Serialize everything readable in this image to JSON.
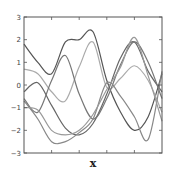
{
  "chart_data": {
    "type": "line",
    "title": "",
    "xlabel": "x",
    "ylabel": "",
    "ylim": [
      -3,
      3
    ],
    "xlim": [
      0,
      1
    ],
    "yticks": [
      -3,
      -2,
      -1,
      0,
      1,
      2,
      3
    ],
    "ytick_labels": [
      "−3",
      "−2",
      "−1",
      "0",
      "1",
      "2",
      "3"
    ],
    "xticks": [
      0.2,
      0.4,
      0.6,
      0.8
    ],
    "xtick_labels": [
      "",
      "",
      "",
      ""
    ],
    "grid": false,
    "legend": null,
    "x": [
      0.0,
      0.1,
      0.2,
      0.3,
      0.4,
      0.5,
      0.6,
      0.7,
      0.8,
      0.9,
      1.0
    ],
    "series": [
      {
        "name": "sample-1",
        "color": "#555555",
        "values": [
          1.8,
          1.0,
          0.5,
          1.9,
          2.0,
          2.35,
          0.2,
          -1.2,
          -2.0,
          -1.4,
          0.5
        ]
      },
      {
        "name": "sample-2",
        "color": "#aaaaaa",
        "values": [
          0.7,
          0.5,
          -0.3,
          -0.7,
          0.8,
          1.9,
          -0.1,
          0.3,
          0.85,
          0.2,
          -1.2
        ]
      },
      {
        "name": "sample-3",
        "color": "#666666",
        "values": [
          -0.3,
          0.1,
          -0.9,
          -1.9,
          -2.2,
          -1.7,
          -0.4,
          1.2,
          1.9,
          0.6,
          -0.3
        ]
      },
      {
        "name": "sample-4",
        "color": "#777777",
        "values": [
          -0.6,
          -1.2,
          0.2,
          1.3,
          -0.4,
          -1.5,
          -0.6,
          0.9,
          1.9,
          1.0,
          -0.6
        ]
      },
      {
        "name": "sample-5",
        "color": "#888888",
        "values": [
          -0.7,
          -1.5,
          -2.5,
          -2.5,
          -2.1,
          -1.5,
          0.1,
          -0.5,
          -1.4,
          -2.4,
          0.6
        ]
      },
      {
        "name": "sample-6",
        "color": "#999999",
        "values": [
          -1.0,
          -1.1,
          -2.0,
          -2.2,
          -2.0,
          -1.3,
          -0.2,
          0.8,
          2.1,
          0.4,
          -1.6
        ]
      }
    ]
  }
}
